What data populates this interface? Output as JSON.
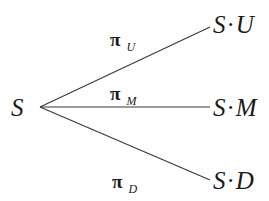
{
  "diagram": {
    "type": "trinomial-tree",
    "root": {
      "label": "S"
    },
    "branches": [
      {
        "id": "up",
        "node": {
          "base": "S",
          "sep": "·",
          "factor": "U"
        },
        "prob": {
          "symbol": "π",
          "sub": "U"
        }
      },
      {
        "id": "middle",
        "node": {
          "base": "S",
          "sep": "·",
          "factor": "M"
        },
        "prob": {
          "symbol": "π",
          "sub": "M"
        }
      },
      {
        "id": "down",
        "node": {
          "base": "S",
          "sep": "·",
          "factor": "D"
        },
        "prob": {
          "symbol": "π",
          "sub": "D"
        }
      }
    ],
    "colors": {
      "line": "#3a3a3a",
      "text": "#1a1a1a",
      "background": "#ffffff"
    }
  }
}
